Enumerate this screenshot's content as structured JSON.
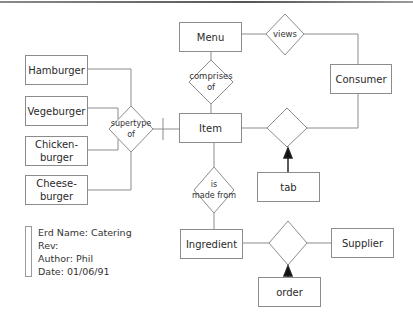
{
  "diagram": {
    "type": "entity-relationship",
    "entities": [
      {
        "id": "menu",
        "label": "Menu"
      },
      {
        "id": "consumer",
        "label": "Consumer"
      },
      {
        "id": "item",
        "label": "Item"
      },
      {
        "id": "hamburger",
        "label": "Hamburger"
      },
      {
        "id": "vegeburger",
        "label": "Vegeburger"
      },
      {
        "id": "chickenburger",
        "label": "Chicken-\nburger"
      },
      {
        "id": "cheeseburger",
        "label": "Cheese-\nburger"
      },
      {
        "id": "tab",
        "label": "tab"
      },
      {
        "id": "ingredient",
        "label": "Ingredient"
      },
      {
        "id": "supplier",
        "label": "Supplier"
      },
      {
        "id": "order",
        "label": "order"
      }
    ],
    "relationships": [
      {
        "id": "views",
        "label": "views",
        "connects": [
          "menu",
          "consumer"
        ]
      },
      {
        "id": "comprises",
        "label": "comprises\nof",
        "connects": [
          "menu",
          "item"
        ]
      },
      {
        "id": "supertype",
        "label": "supertype\nof",
        "connects": [
          "item",
          "hamburger",
          "vegeburger",
          "chickenburger",
          "cheeseburger"
        ]
      },
      {
        "id": "item_consumer",
        "label": "",
        "connects": [
          "item",
          "consumer"
        ],
        "associative_entity": "tab"
      },
      {
        "id": "made_from",
        "label": "is\nmade from",
        "connects": [
          "item",
          "ingredient"
        ]
      },
      {
        "id": "ingredient_supplier",
        "label": "",
        "connects": [
          "ingredient",
          "supplier"
        ],
        "associative_entity": "order"
      }
    ]
  },
  "labels": {
    "menu": "Menu",
    "consumer": "Consumer",
    "item": "Item",
    "hamburger": "Hamburger",
    "vegeburger": "Vegeburger",
    "chicken1": "Chicken-",
    "chicken2": "burger",
    "cheese1": "Cheese-",
    "cheese2": "burger",
    "tab": "tab",
    "ingredient": "Ingredient",
    "supplier": "Supplier",
    "order": "order",
    "views": "views",
    "comprises1": "comprises",
    "comprises2": "of",
    "supertype1": "supertype",
    "supertype2": "of",
    "madefrom1": "is",
    "madefrom2": "made from"
  },
  "legend": {
    "name": "Erd Name: Catering",
    "rev": "Rev:",
    "author": "Author: Phil",
    "date": "Date: 01/06/91"
  }
}
